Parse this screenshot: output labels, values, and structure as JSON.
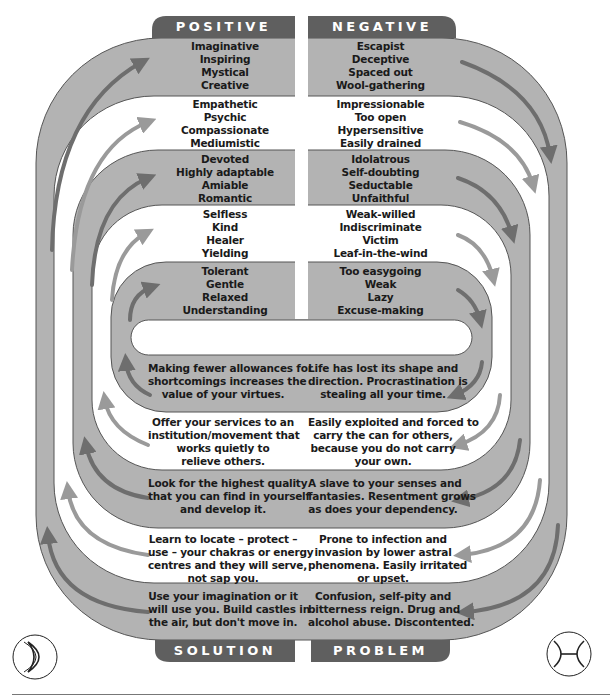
{
  "headers": {
    "positive": "POSITIVE",
    "negative": "NEGATIVE",
    "solution": "SOLUTION",
    "problem": "PROBLEM"
  },
  "colors": {
    "band_gray": "#b3b3b3",
    "label_dark": "#5f5f5f",
    "arrow_dark": "#6e6e6e",
    "arrow_light": "#9a9a9a",
    "outline": "#555555"
  },
  "rows": [
    {
      "band": "gray",
      "positive": [
        "Imaginative",
        "Inspiring",
        "Mystical",
        "Creative"
      ],
      "negative": [
        "Escapist",
        "Deceptive",
        "Spaced out",
        "Wool-gathering"
      ]
    },
    {
      "band": "white",
      "positive": [
        "Empathetic",
        "Psychic",
        "Compassionate",
        "Mediumistic"
      ],
      "negative": [
        "Impressionable",
        "Too open",
        "Hypersensitive",
        "Easily drained"
      ]
    },
    {
      "band": "gray",
      "positive": [
        "Devoted",
        "Highly adaptable",
        "Amiable",
        "Romantic"
      ],
      "negative": [
        "Idolatrous",
        "Self-doubting",
        "Seductable",
        "Unfaithful"
      ]
    },
    {
      "band": "white",
      "positive": [
        "Selfless",
        "Kind",
        "Healer",
        "Yielding"
      ],
      "negative": [
        "Weak-willed",
        "Indiscriminate",
        "Victim",
        "Leaf-in-the-wind"
      ]
    },
    {
      "band": "gray",
      "positive": [
        "Tolerant",
        "Gentle",
        "Relaxed",
        "Understanding"
      ],
      "negative": [
        "Too easygoing",
        "Weak",
        "Lazy",
        "Excuse-making"
      ]
    }
  ],
  "lower_rows": [
    {
      "band": "gray",
      "solution": [
        "Making fewer allowances for",
        "shortcomings increases the",
        "value of your virtues."
      ],
      "problem": [
        "Life has lost its shape and",
        "direction. Procrastination is",
        "stealing all your time."
      ]
    },
    {
      "band": "white",
      "solution": [
        "Offer your services to an",
        "institution/movement that",
        "works quietly to",
        "relieve others."
      ],
      "problem": [
        "Easily exploited and forced to",
        "carry the can for others,",
        "because you do not carry",
        "your own."
      ]
    },
    {
      "band": "gray",
      "solution": [
        "Look for the highest quality",
        "that you can find in yourself",
        "and develop it."
      ],
      "problem": [
        "A slave to your senses and",
        "fantasies. Resentment grows",
        "as does your dependency."
      ]
    },
    {
      "band": "white",
      "solution": [
        "Learn to locate – protect –",
        "use – your chakras or energy",
        "centres and they will serve,",
        "not sap you."
      ],
      "problem": [
        "Prone to infection and",
        "invasion by lower astral",
        "phenomena. Easily irritated",
        "or upset."
      ]
    },
    {
      "band": "gray",
      "solution": [
        "Use your imagination or it",
        "will use you.  Build castles in",
        "the air, but don't move in."
      ],
      "problem": [
        "Confusion, self-pity and",
        "bitterness reign. Drug and",
        "alcohol abuse. Discontented."
      ]
    }
  ],
  "icons": {
    "left": "moon-crescent-icon",
    "right": "pisces-symbol-icon"
  }
}
